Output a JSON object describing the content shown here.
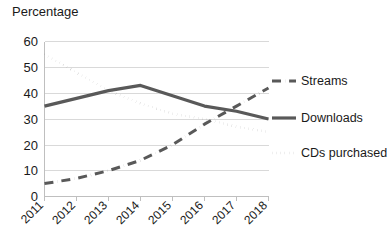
{
  "chart_data": {
    "type": "line",
    "title": "Percentage",
    "xlabel": "",
    "ylabel": "Percentage",
    "categories": [
      "2011",
      "2012",
      "2013",
      "2014",
      "2015",
      "2016",
      "2017",
      "2018"
    ],
    "x": [
      2011,
      2012,
      2013,
      2014,
      2015,
      2016,
      2017,
      2018
    ],
    "ylim": [
      0,
      60
    ],
    "yticks": [
      0,
      10,
      20,
      30,
      40,
      50,
      60
    ],
    "ytick_labels": [
      "0",
      "10",
      "20",
      "30",
      "40",
      "50",
      "60"
    ],
    "grid": true,
    "legend_position": "right",
    "series": [
      {
        "name": "Streams",
        "style": "dash-dot",
        "color": "#595959",
        "values": [
          5,
          7,
          10,
          14,
          20,
          28,
          35,
          42
        ]
      },
      {
        "name": "Downloads",
        "style": "solid",
        "color": "#595959",
        "values": [
          35,
          38,
          41,
          43,
          39,
          35,
          33,
          30
        ]
      },
      {
        "name": "CDs purchased",
        "style": "dotted",
        "color": "#595959",
        "values": [
          55,
          48,
          41,
          36,
          32,
          30,
          27,
          25
        ]
      }
    ]
  },
  "axis": {
    "title": "Percentage",
    "ytick_0": "0",
    "ytick_1": "10",
    "ytick_2": "20",
    "ytick_3": "30",
    "ytick_4": "40",
    "ytick_5": "50",
    "ytick_6": "60",
    "xtick_0": "2011",
    "xtick_1": "2012",
    "xtick_2": "2013",
    "xtick_3": "2014",
    "xtick_4": "2015",
    "xtick_5": "2016",
    "xtick_6": "2017",
    "xtick_7": "2018"
  },
  "legend": {
    "items": [
      {
        "label": "Streams",
        "style": "dash-dot"
      },
      {
        "label": "Downloads",
        "style": "solid"
      },
      {
        "label": "CDs purchased",
        "style": "dotted"
      }
    ],
    "item_0_label": "Streams",
    "item_1_label": "Downloads",
    "item_2_label": "CDs purchased"
  }
}
